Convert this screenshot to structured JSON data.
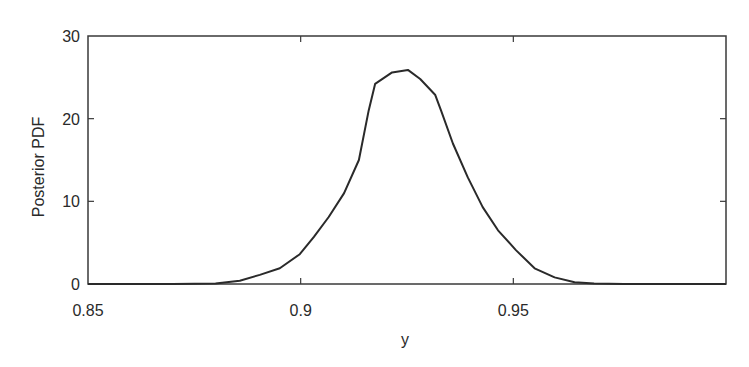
{
  "chart_data": {
    "type": "line",
    "title": "",
    "xlabel": "y",
    "ylabel": "Posterior PDF",
    "xlim": [
      0.85,
      1.0
    ],
    "ylim": [
      0,
      30
    ],
    "grid": false,
    "legend": null,
    "x_ticks": [
      0.85,
      0.9,
      0.95
    ],
    "x_tick_labels": [
      "0.85",
      "0.9",
      "0.95"
    ],
    "y_ticks": [
      0,
      10,
      20,
      30
    ],
    "y_tick_labels": [
      "0",
      "10",
      "20",
      "30"
    ],
    "series": [
      {
        "name": "Posterior PDF",
        "color": "#2a2a2a",
        "x": [
          0.85,
          0.87,
          0.88,
          0.8857,
          0.8904,
          0.8951,
          0.8998,
          0.9031,
          0.9066,
          0.9102,
          0.9137,
          0.916,
          0.9175,
          0.9215,
          0.9252,
          0.9281,
          0.9316,
          0.933,
          0.9358,
          0.9393,
          0.9428,
          0.9464,
          0.9506,
          0.955,
          0.9597,
          0.9644,
          0.969,
          0.976,
          0.985,
          1.0
        ],
        "y": [
          0,
          0,
          0.05,
          0.4,
          1.1,
          1.9,
          3.6,
          5.7,
          8.1,
          11.0,
          15.0,
          21.0,
          24.2,
          25.6,
          25.9,
          24.8,
          22.9,
          21.0,
          17.0,
          12.9,
          9.3,
          6.5,
          4.1,
          1.9,
          0.8,
          0.2,
          0.05,
          0,
          0,
          0
        ]
      }
    ]
  },
  "axes": {
    "xlabel": "y",
    "ylabel": "Posterior PDF"
  }
}
